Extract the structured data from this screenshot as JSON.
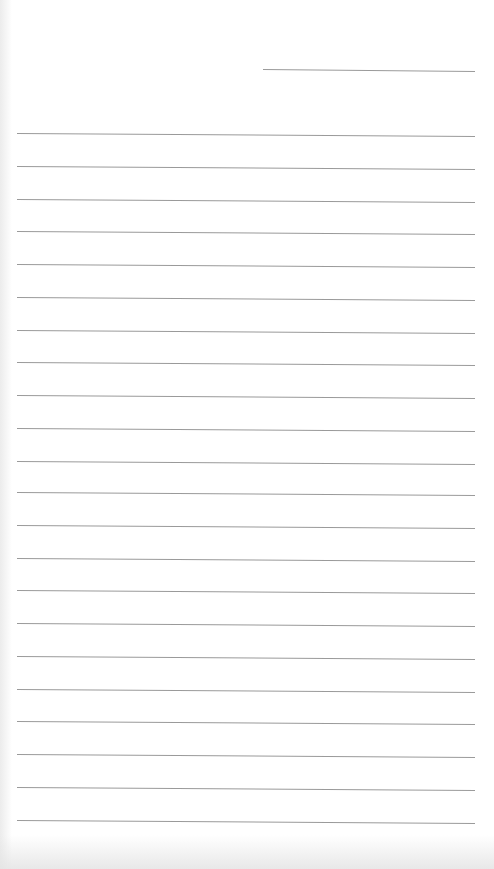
{
  "paper": {
    "type": "lined notebook paper",
    "background_color": "#ffffff",
    "line_color": "#9a9a9a",
    "header_line": {
      "x1": 263,
      "y1": 69,
      "x2": 475,
      "y2": 71
    },
    "ruled_lines": [
      {
        "y_left": 133,
        "y_right": 136
      },
      {
        "y_left": 166,
        "y_right": 169
      },
      {
        "y_left": 199,
        "y_right": 202
      },
      {
        "y_left": 231,
        "y_right": 234
      },
      {
        "y_left": 264,
        "y_right": 267
      },
      {
        "y_left": 297,
        "y_right": 300
      },
      {
        "y_left": 330,
        "y_right": 333
      },
      {
        "y_left": 362,
        "y_right": 365
      },
      {
        "y_left": 395,
        "y_right": 398
      },
      {
        "y_left": 428,
        "y_right": 431
      },
      {
        "y_left": 461,
        "y_right": 464
      },
      {
        "y_left": 492,
        "y_right": 495
      },
      {
        "y_left": 525,
        "y_right": 528
      },
      {
        "y_left": 558,
        "y_right": 561
      },
      {
        "y_left": 590,
        "y_right": 593
      },
      {
        "y_left": 623,
        "y_right": 626
      },
      {
        "y_left": 656,
        "y_right": 659
      },
      {
        "y_left": 689,
        "y_right": 692
      },
      {
        "y_left": 721,
        "y_right": 724
      },
      {
        "y_left": 754,
        "y_right": 757
      },
      {
        "y_left": 787,
        "y_right": 790
      },
      {
        "y_left": 820,
        "y_right": 823
      }
    ],
    "ruled_line_x_start": 17,
    "ruled_line_x_end": 475
  }
}
